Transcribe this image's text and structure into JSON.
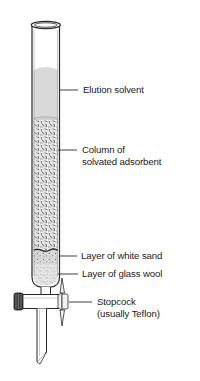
{
  "diagram": {
    "labels": {
      "elution_solvent": "Elution solvent",
      "column_line1": "Column of",
      "column_line2": "solvated adsorbent",
      "white_sand": "Layer of white sand",
      "glass_wool": "Layer of glass wool",
      "stopcock_line1": "Stopcock",
      "stopcock_line2": "(usually Teflon)"
    },
    "colors": {
      "outline": "#2a2a2a",
      "solvent": "#d9d9d9",
      "adsorbent_bg": "#e6e6e6",
      "adsorbent_specks": "#3a3a3a",
      "sand": "#d4d4d4",
      "glass_wool": "#e2e2e2",
      "background": "#ffffff"
    }
  }
}
